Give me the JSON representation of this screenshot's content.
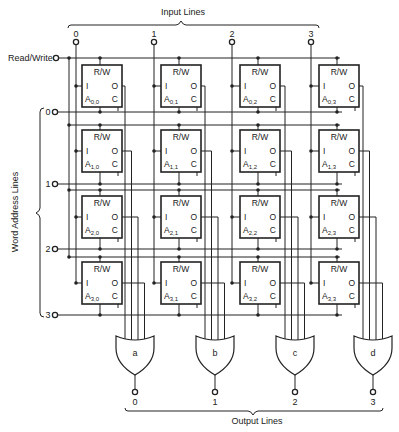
{
  "labels": {
    "input_lines": "Input Lines",
    "output_lines": "Output Lines",
    "word_address_lines": "Word Address Lines",
    "read_write": "Read/Write"
  },
  "input_lines": [
    "0",
    "1",
    "2",
    "3"
  ],
  "word_address_lines": [
    "0",
    "1",
    "2",
    "3"
  ],
  "output_lines": [
    "0",
    "1",
    "2",
    "3"
  ],
  "gates": [
    {
      "name": "a",
      "type": "OR"
    },
    {
      "name": "b",
      "type": "OR"
    },
    {
      "name": "c",
      "type": "OR"
    },
    {
      "name": "d",
      "type": "OR"
    }
  ],
  "cell_pins": {
    "top": "R/W",
    "in": "I",
    "out": "O",
    "ctrl": "C",
    "name_prefix": "A"
  },
  "cells": [
    [
      "0,0",
      "0,1",
      "0,2",
      "0,3"
    ],
    [
      "1,0",
      "1,1",
      "1,2",
      "1,3"
    ],
    [
      "2,0",
      "2,1",
      "2,2",
      "2,3"
    ],
    [
      "3,0",
      "3,1",
      "3,2",
      "3,3"
    ]
  ]
}
